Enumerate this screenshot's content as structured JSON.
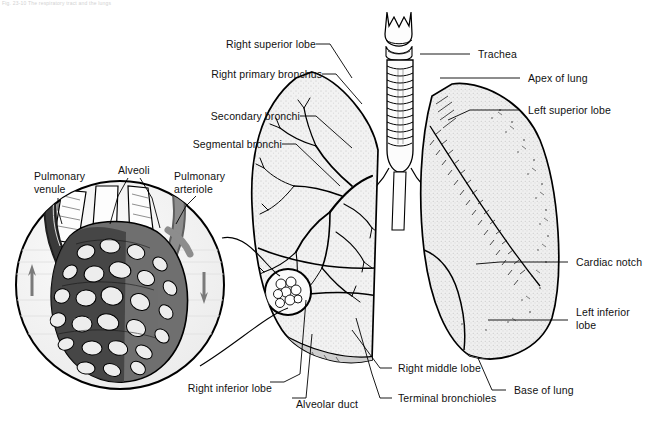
{
  "figure": {
    "caption_clipped": "Fig. 23-10  The respiratory tract and the lungs",
    "background_color": "#ffffff",
    "ink_color": "#000000"
  },
  "labels": {
    "left_stack": [
      {
        "id": "right-superior-lobe",
        "text": "Right superior lobe"
      },
      {
        "id": "right-primary-bronchus",
        "text": "Right primary bronchus"
      },
      {
        "id": "secondary-bronchi",
        "text": "Secondary bronchi"
      },
      {
        "id": "segmental-bronchi",
        "text": "Segmental bronchi"
      }
    ],
    "right_stack": [
      {
        "id": "trachea",
        "text": "Trachea"
      },
      {
        "id": "apex-of-lung",
        "text": "Apex of lung"
      },
      {
        "id": "left-superior-lobe",
        "text": "Left superior lobe"
      },
      {
        "id": "cardiac-notch",
        "text": "Cardiac notch"
      },
      {
        "id": "left-inferior-lobe",
        "text": "Left inferior\nlobe"
      },
      {
        "id": "base-of-lung",
        "text": "Base of lung"
      }
    ],
    "bottom": [
      {
        "id": "right-inferior-lobe",
        "text": "Right inferior lobe"
      },
      {
        "id": "alveolar-duct",
        "text": "Alveolar duct"
      },
      {
        "id": "right-middle-lobe",
        "text": "Right middle lobe"
      },
      {
        "id": "terminal-bronchioles",
        "text": "Terminal bronchioles"
      }
    ],
    "inset": [
      {
        "id": "pulmonary-venule",
        "text": "Pulmonary\nvenule"
      },
      {
        "id": "alveoli",
        "text": "Alveoli"
      },
      {
        "id": "pulmonary-arteriole",
        "text": "Pulmonary\narteriole"
      }
    ]
  },
  "inset_detail": {
    "shape": "circle",
    "center_x": 120,
    "center_y": 285,
    "radius": 105,
    "venule_color": "#3a3a3a",
    "arteriole_color": "#8d8d8d",
    "capillary_color": "#6f6f6f",
    "alveoli_fill": "#ededed",
    "flow_arrow_up": "blood-flow-up-arrow",
    "flow_arrow_down": "blood-flow-down-arrow"
  },
  "anatomy": {
    "trachea": {
      "rings": 13,
      "larynx": "thyroid cartilage"
    },
    "right_lung": {
      "lobes": [
        "superior",
        "middle",
        "inferior"
      ],
      "shading": "bronchial-tree"
    },
    "left_lung": {
      "lobes": [
        "superior",
        "inferior"
      ],
      "shading": "stipple"
    }
  }
}
